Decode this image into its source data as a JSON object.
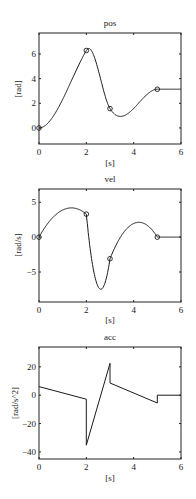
{
  "chart_data": [
    {
      "type": "line",
      "title": "pos",
      "xlabel": "[s]",
      "ylabel": "[rad]",
      "xlim": [
        0,
        6
      ],
      "ylim": [
        -1.3,
        7.7
      ],
      "xticks": [
        0,
        2,
        4,
        6
      ],
      "yticks": [
        0,
        2,
        4,
        6
      ],
      "grid": false,
      "series": [
        {
          "name": "position",
          "derived_from": "cubic segments through knots",
          "markers": {
            "x": [
              0,
              2,
              3,
              5
            ],
            "y": [
              0,
              6.28,
              1.57,
              3.14
            ]
          }
        }
      ]
    },
    {
      "type": "line",
      "title": "vel",
      "xlabel": "[s]",
      "ylabel": "[rad/s]",
      "xlim": [
        0,
        6
      ],
      "ylim": [
        -9.3,
        6.9
      ],
      "xticks": [
        0,
        2,
        4,
        6
      ],
      "yticks": [
        -5,
        0,
        5
      ],
      "grid": false,
      "series": [
        {
          "name": "velocity",
          "markers": {
            "x": [
              0,
              2,
              3,
              5
            ],
            "y": [
              0,
              3.3,
              -3.1,
              0
            ]
          },
          "extrema": {
            "max1": [
              1.37,
              4.18
            ],
            "min": [
              2.6,
              -7.1
            ],
            "max2": [
              4.2,
              2.2
            ]
          }
        }
      ]
    },
    {
      "type": "line",
      "title": "acc",
      "xlabel": "[s]",
      "ylabel": "[rad/s^2]",
      "xlim": [
        0,
        6
      ],
      "ylim": [
        -45,
        34
      ],
      "xticks": [
        0,
        2,
        4,
        6
      ],
      "yticks": [
        -40,
        -20,
        0,
        20
      ],
      "grid": false,
      "series": [
        {
          "name": "acceleration",
          "x": [
            0,
            2,
            2,
            3,
            3,
            5,
            5,
            6
          ],
          "y": [
            6.1,
            -2.8,
            -35.3,
            22.5,
            8.6,
            -5.5,
            0,
            0
          ]
        }
      ]
    }
  ],
  "trajectory": {
    "knots_t": [
      0,
      2,
      3,
      5,
      6
    ],
    "knots_q": [
      0,
      6.2832,
      1.5708,
      3.1416,
      3.1416
    ],
    "knots_v": [
      0,
      3.3,
      -3.1,
      0,
      0
    ]
  },
  "labels": {
    "pos_title": "pos",
    "vel_title": "vel",
    "acc_title": "acc",
    "xlabel": "[s]",
    "pos_ylabel": "[rad]",
    "vel_ylabel": "[rad/s]",
    "acc_ylabel": "[rad/s^2]"
  }
}
